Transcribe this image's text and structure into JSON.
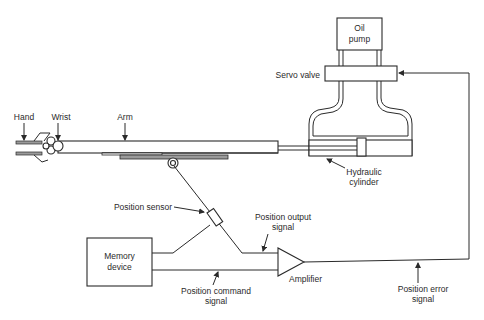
{
  "diagram": {
    "type": "robot-hydraulic-servo-control-block-diagram",
    "components": {
      "oil_pump": {
        "label_line1": "Oil",
        "label_line2": "pump"
      },
      "servo_valve": {
        "label": "Servo valve"
      },
      "hydraulic_cylinder": {
        "label_line1": "Hydraulic",
        "label_line2": "cylinder"
      },
      "hand": {
        "label": "Hand"
      },
      "wrist": {
        "label": "Wrist"
      },
      "arm": {
        "label": "Arm"
      },
      "position_sensor": {
        "label": "Position sensor"
      },
      "memory_device": {
        "label_line1": "Memory",
        "label_line2": "device"
      },
      "amplifier": {
        "label": "Amplifier"
      }
    },
    "signals": {
      "position_output": {
        "label_line1": "Position output",
        "label_line2": "signal"
      },
      "position_command": {
        "label_line1": "Position command",
        "label_line2": "signal"
      },
      "position_error": {
        "label_line1": "Position error",
        "label_line2": "signal"
      }
    },
    "colors": {
      "line": "#2a2a2a",
      "background": "#ffffff",
      "shade": "#9a9a9a"
    }
  }
}
